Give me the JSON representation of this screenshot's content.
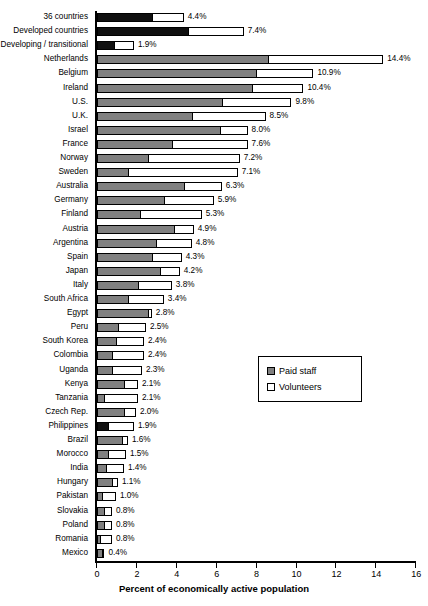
{
  "chart_data": {
    "type": "bar",
    "orientation": "horizontal",
    "stacked": true,
    "title": "",
    "xlabel": "Percent of economically active population",
    "ylabel": "",
    "xlim": [
      0,
      16
    ],
    "xticks": [
      0,
      2,
      4,
      6,
      8,
      10,
      12,
      14,
      16
    ],
    "grid": false,
    "legend": {
      "position": "middle-right",
      "entries": [
        {
          "name": "Paid staff",
          "color": "#808080"
        },
        {
          "name": "Volunteers",
          "color": "#ffffff"
        }
      ]
    },
    "series": [
      {
        "name": "Paid staff",
        "values": [
          2.8,
          4.6,
          0.9,
          8.6,
          8.0,
          7.8,
          6.3,
          4.8,
          6.2,
          3.8,
          2.6,
          1.6,
          4.4,
          3.4,
          2.2,
          3.9,
          3.0,
          2.8,
          3.2,
          2.1,
          1.6,
          2.6,
          1.1,
          1.0,
          0.8,
          0.8,
          1.4,
          0.4,
          1.4,
          0.6,
          1.3,
          0.6,
          0.5,
          0.8,
          0.3,
          0.4,
          0.4,
          0.2,
          0.3
        ]
      },
      {
        "name": "Volunteers",
        "values": [
          1.6,
          2.8,
          1.0,
          5.8,
          2.9,
          2.6,
          3.5,
          3.7,
          1.4,
          3.8,
          4.6,
          5.5,
          1.9,
          2.5,
          3.1,
          1.0,
          1.8,
          1.5,
          1.0,
          1.7,
          1.8,
          0.2,
          1.4,
          1.4,
          1.6,
          1.5,
          0.7,
          1.7,
          0.6,
          1.3,
          0.3,
          0.9,
          0.9,
          0.3,
          0.7,
          0.4,
          0.4,
          0.6,
          0.1
        ]
      }
    ],
    "categories": [
      "36 countries",
      "Developed countries",
      "Developing / transitional",
      "Netherlands",
      "Belgium",
      "Ireland",
      "U.S.",
      "U.K.",
      "Israel",
      "France",
      "Norway",
      "Sweden",
      "Australia",
      "Germany",
      "Finland",
      "Austria",
      "Argentina",
      "Spain",
      "Japan",
      "Italy",
      "South Africa",
      "Egypt",
      "Peru",
      "South Korea",
      "Colombia",
      "Uganda",
      "Kenya",
      "Tanzania",
      "Czech Rep.",
      "Philippines",
      "Brazil",
      "Morocco",
      "India",
      "Hungary",
      "Pakistan",
      "Slovakia",
      "Poland",
      "Romania",
      "Mexico"
    ],
    "totals": [
      4.4,
      7.4,
      1.9,
      14.4,
      10.9,
      10.4,
      9.8,
      8.5,
      8.0,
      7.6,
      7.2,
      7.1,
      6.3,
      5.9,
      5.3,
      4.9,
      4.8,
      4.3,
      4.2,
      3.8,
      3.4,
      2.8,
      2.5,
      2.4,
      2.4,
      2.3,
      2.1,
      2.1,
      2.0,
      1.9,
      1.6,
      1.5,
      1.4,
      1.1,
      1.0,
      0.8,
      0.8,
      0.8,
      0.4
    ],
    "value_labels": [
      "4.4%",
      "7.4%",
      "1.9%",
      "14.4%",
      "10.9%",
      "10.4%",
      "9.8%",
      "8.5%",
      "8.0%",
      "7.6%",
      "7.2%",
      "7.1%",
      "6.3%",
      "5.9%",
      "5.3%",
      "4.9%",
      "4.8%",
      "4.3%",
      "4.2%",
      "3.8%",
      "3.4%",
      "2.8%",
      "2.5%",
      "2.4%",
      "2.4%",
      "2.3%",
      "2.1%",
      "2.1%",
      "2.0%",
      "1.9%",
      "1.6%",
      "1.5%",
      "1.4%",
      "1.1%",
      "1.0%",
      "0.8%",
      "0.8%",
      "0.8%",
      "0.4%"
    ],
    "tick_labels": [
      "0",
      "2",
      "4",
      "6",
      "8",
      "10",
      "12",
      "14",
      "16"
    ],
    "aggregate_rows": [
      0,
      1,
      2
    ],
    "highlighted_rows": [
      29
    ],
    "colors": {
      "paid_staff": "#808080",
      "paid_staff_aggregate": "#101010",
      "volunteers": "#ffffff",
      "outline": "#000000"
    }
  }
}
